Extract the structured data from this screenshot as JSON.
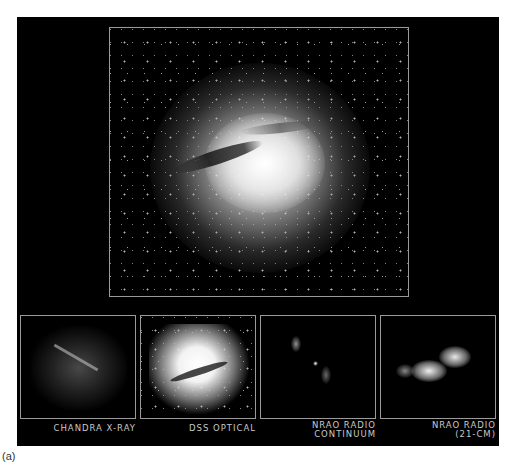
{
  "figure": {
    "main_image": {
      "subject": "Centaurus A galaxy (composite optical)",
      "description": "bright elliptical galaxy with dark dust lane crossing center, star field background"
    },
    "panels": [
      {
        "label_line1": "Chandra X-ray",
        "label_line2": ""
      },
      {
        "label_line1": "DSS Optical",
        "label_line2": ""
      },
      {
        "label_line1": "NRAO Radio",
        "label_line2": "Continuum"
      },
      {
        "label_line1": "NRAO Radio",
        "label_line2": "(21-cm)"
      }
    ],
    "caption": "(a)"
  },
  "colors": {
    "panel_background": "#000000",
    "frame_border": "#9a9a9a",
    "label_text": "#c8c8c8",
    "page_background": "#ffffff"
  }
}
